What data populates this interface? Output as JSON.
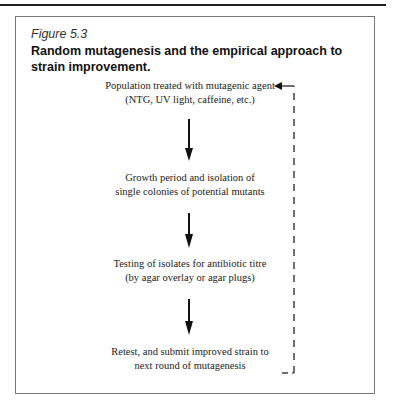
{
  "figure": {
    "label": "Figure 5.3",
    "title": "Random mutagenesis and the empirical approach to strain improvement."
  },
  "steps": [
    {
      "line1": "Population treated with mutagenic agent",
      "line2": "(NTG, UV light, caffeine, etc.)"
    },
    {
      "line1": "Growth period and isolation of",
      "line2": "single colonies of potential mutants"
    },
    {
      "line1": "Testing of isolates for antibiotic titre",
      "line2": "(by agar overlay or agar plugs)"
    },
    {
      "line1": "Retest, and submit improved  strain to",
      "line2": "next round of mutagenesis"
    }
  ],
  "connectors": {
    "forward": "solid-down-arrow",
    "feedback": "dashed-loop-arrow"
  }
}
